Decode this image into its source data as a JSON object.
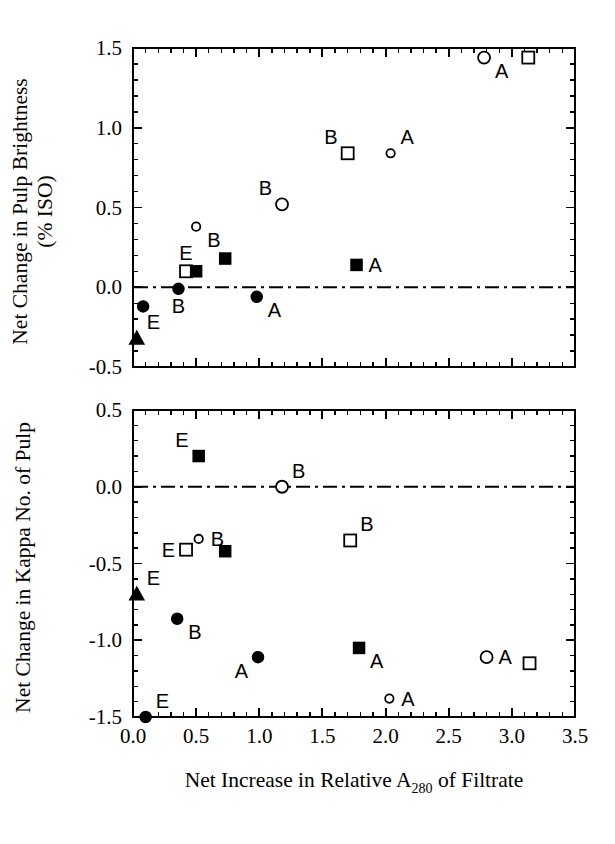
{
  "figure": {
    "background": "#ffffff",
    "ink_color": "#000000"
  },
  "chart_data": [
    {
      "id": "top-panel",
      "type": "scatter",
      "title": "",
      "xlabel": "",
      "ylabel": "Net Change in Pulp Brightness (% ISO)",
      "ylabel_line1": "Net Change in Pulp Brightness",
      "ylabel_line2": "(% ISO)",
      "xlim": [
        0.0,
        3.5
      ],
      "ylim": [
        -0.5,
        1.5
      ],
      "xticks": [
        0.0,
        0.5,
        1.0,
        1.5,
        2.0,
        2.5,
        3.0,
        3.5
      ],
      "xticklabels": [
        "",
        "",
        "",
        "",
        "",
        "",
        "",
        ""
      ],
      "yticks": [
        -0.5,
        0.0,
        0.5,
        1.0,
        1.5
      ],
      "yticklabels": [
        "-0.5",
        "0.0",
        "0.5",
        "1.0",
        "1.5"
      ],
      "minor_tick_count": 4,
      "grid": false,
      "legend": false,
      "reference_line": {
        "axis": "y",
        "value": 0.0,
        "style": "dash-dot"
      },
      "points": [
        {
          "x": 0.03,
          "y": -0.32,
          "marker": "filled-triangle",
          "label": "E",
          "label_pos": "above-right"
        },
        {
          "x": 0.08,
          "y": -0.12,
          "marker": "filled-circle",
          "label": "",
          "label_pos": "none"
        },
        {
          "x": 0.42,
          "y": 0.1,
          "marker": "open-square",
          "label": "E",
          "label_pos": "above"
        },
        {
          "x": 0.5,
          "y": 0.1,
          "marker": "filled-square",
          "label": "",
          "label_pos": "none"
        },
        {
          "x": 0.36,
          "y": -0.01,
          "marker": "filled-circle",
          "label": "B",
          "label_pos": "below"
        },
        {
          "x": 0.5,
          "y": 0.38,
          "marker": "open-circle-small",
          "label": "B",
          "label_pos": "below-right"
        },
        {
          "x": 0.73,
          "y": 0.18,
          "marker": "filled-square",
          "label": "",
          "label_pos": "none"
        },
        {
          "x": 0.98,
          "y": -0.06,
          "marker": "filled-circle",
          "label": "A",
          "label_pos": "below-right"
        },
        {
          "x": 1.18,
          "y": 0.52,
          "marker": "open-circle",
          "label": "B",
          "label_pos": "above-left"
        },
        {
          "x": 1.7,
          "y": 0.84,
          "marker": "open-square",
          "label": "B",
          "label_pos": "above-left"
        },
        {
          "x": 1.77,
          "y": 0.14,
          "marker": "filled-square",
          "label": "A",
          "label_pos": "right"
        },
        {
          "x": 2.04,
          "y": 0.84,
          "marker": "open-circle-small",
          "label": "A",
          "label_pos": "above-right"
        },
        {
          "x": 2.78,
          "y": 1.44,
          "marker": "open-circle",
          "label": "A",
          "label_pos": "below-right"
        },
        {
          "x": 3.13,
          "y": 1.44,
          "marker": "open-square",
          "label": "",
          "label_pos": "none"
        }
      ]
    },
    {
      "id": "bottom-panel",
      "type": "scatter",
      "title": "",
      "xlabel": "Net Increase in Relative A280 of Filtrate",
      "xlabel_pre": "Net Increase in Relative A",
      "xlabel_sub": "280",
      "xlabel_post": " of Filtrate",
      "ylabel": "Net Change in Kappa No. of Pulp",
      "xlim": [
        0.0,
        3.5
      ],
      "ylim": [
        -1.5,
        0.5
      ],
      "xticks": [
        0.0,
        0.5,
        1.0,
        1.5,
        2.0,
        2.5,
        3.0,
        3.5
      ],
      "xticklabels": [
        "0.0",
        "0.5",
        "1.0",
        "1.5",
        "2.0",
        "2.5",
        "3.0",
        "3.5"
      ],
      "yticks": [
        -1.5,
        -1.0,
        -0.5,
        0.0,
        0.5
      ],
      "yticklabels": [
        "-1.5",
        "-1.0",
        "-0.5",
        "0.0",
        "0.5"
      ],
      "minor_tick_count": 4,
      "grid": false,
      "legend": false,
      "reference_line": {
        "axis": "y",
        "value": 0.0,
        "style": "dash-dot"
      },
      "points": [
        {
          "x": 0.03,
          "y": -0.7,
          "marker": "filled-triangle",
          "label": "E",
          "label_pos": "above-right"
        },
        {
          "x": 0.1,
          "y": -1.5,
          "marker": "filled-circle",
          "label": "E",
          "label_pos": "above-right"
        },
        {
          "x": 0.35,
          "y": -0.86,
          "marker": "filled-circle",
          "label": "B",
          "label_pos": "below-right"
        },
        {
          "x": 0.42,
          "y": -0.41,
          "marker": "open-square",
          "label": "E",
          "label_pos": "left"
        },
        {
          "x": 0.52,
          "y": -0.34,
          "marker": "open-circle-small",
          "label": "B",
          "label_pos": "right"
        },
        {
          "x": 0.52,
          "y": 0.2,
          "marker": "filled-square",
          "label": "E",
          "label_pos": "above-left"
        },
        {
          "x": 0.73,
          "y": -0.42,
          "marker": "filled-square",
          "label": "",
          "label_pos": "none"
        },
        {
          "x": 0.99,
          "y": -1.11,
          "marker": "filled-circle",
          "label": "A",
          "label_pos": "below-left"
        },
        {
          "x": 1.18,
          "y": 0.0,
          "marker": "open-circle",
          "label": "B",
          "label_pos": "above-right"
        },
        {
          "x": 1.72,
          "y": -0.35,
          "marker": "open-square",
          "label": "B",
          "label_pos": "above-right"
        },
        {
          "x": 1.79,
          "y": -1.05,
          "marker": "filled-square",
          "label": "A",
          "label_pos": "below-right"
        },
        {
          "x": 2.03,
          "y": -1.38,
          "marker": "open-circle-small",
          "label": "A",
          "label_pos": "right"
        },
        {
          "x": 2.8,
          "y": -1.11,
          "marker": "open-circle",
          "label": "A",
          "label_pos": "right"
        },
        {
          "x": 3.14,
          "y": -1.15,
          "marker": "open-square",
          "label": "",
          "label_pos": "none"
        }
      ]
    }
  ]
}
